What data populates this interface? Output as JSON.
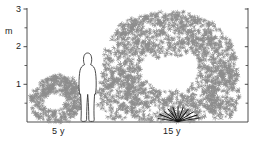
{
  "figure": {
    "title": "",
    "background_color": "#ffffff",
    "ink_color": "#1a1a1a",
    "foliage_color": "#8d8d8d",
    "stem_color": "#111111"
  },
  "axes": {
    "y_unit_label": "m",
    "y_tick_labels": [
      "3",
      "2",
      "1"
    ],
    "y_major_values": [
      3,
      2,
      1
    ],
    "y_minor_values": [
      2.5,
      1.5,
      0.5
    ],
    "y_range": [
      0,
      3.15
    ],
    "x_labels": [
      "5 y",
      "15 y"
    ],
    "baseline_visible": true,
    "right_axis_visible": true,
    "right_axis_ticks": [
      3,
      2.5,
      2,
      1.5,
      1,
      0.5
    ]
  },
  "chart_data": {
    "type": "diagram",
    "title": "",
    "xlabel": "",
    "ylabel": "m",
    "ylim": [
      0,
      3.15
    ],
    "grid": false,
    "legend": false,
    "categories": [
      "5 y",
      "15 y"
    ],
    "series": [
      {
        "name": "shrub height (m)",
        "values": [
          1.1,
          3.0
        ]
      },
      {
        "name": "shrub width (m)",
        "values": [
          1.6,
          4.2
        ]
      }
    ],
    "annotations": [
      {
        "text": "m",
        "role": "y-axis-unit"
      },
      {
        "text": "3",
        "role": "y-tick"
      },
      {
        "text": "2",
        "role": "y-tick"
      },
      {
        "text": "1",
        "role": "y-tick"
      },
      {
        "text": "5 y",
        "role": "x-category"
      },
      {
        "text": "15 y",
        "role": "x-category"
      }
    ],
    "elements": [
      {
        "name": "young-shrub",
        "age_label": "5 y",
        "approx_height_m": 1.1
      },
      {
        "name": "human-figure",
        "approx_height_m": 1.8
      },
      {
        "name": "mature-shrub",
        "age_label": "15 y",
        "approx_height_m": 3.0
      }
    ]
  }
}
